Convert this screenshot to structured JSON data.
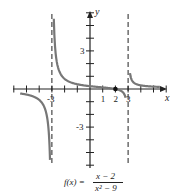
{
  "chart_data": {
    "type": "line",
    "title": "",
    "function": "f(x) = (x-2)/(x^2-9)",
    "xlabel": "x",
    "ylabel": "y",
    "xlim": [
      -6,
      6
    ],
    "ylim": [
      -6,
      6
    ],
    "grid": false,
    "x_tick_labels": [
      {
        "value": -3,
        "label": "-3"
      },
      {
        "value": 1,
        "label": "1"
      },
      {
        "value": 2,
        "label": "2"
      },
      {
        "value": 3,
        "label": "3"
      }
    ],
    "y_tick_labels": [
      {
        "value": 3,
        "label": "3"
      },
      {
        "value": -3,
        "label": "-3"
      }
    ],
    "vertical_asymptotes": [
      -3,
      3
    ],
    "horizontal_asymptote": 0,
    "marked_points": [
      {
        "x": 2,
        "y": 0
      }
    ],
    "y_intercept": 0.222,
    "series": [
      {
        "name": "f(x)",
        "branches": [
          {
            "x": [
              -5.5,
              -5,
              -4.5,
              -4,
              -3.5,
              -3.3,
              -3.15
            ],
            "y": [
              -0.35,
              -0.44,
              -0.58,
              -0.86,
              -1.69,
              -2.98,
              -5.9
            ]
          },
          {
            "x": [
              -2.85,
              -2.7,
              -2.5,
              -2,
              -1,
              0,
              1,
              2,
              2.5,
              2.8
            ],
            "y": [
              5.64,
              3.0,
              1.64,
              0.8,
              0.375,
              0.222,
              0.125,
              0,
              -0.18,
              -0.69
            ]
          },
          {
            "x": [
              3.15,
              3.3,
              3.5,
              4,
              4.5,
              5,
              5.5
            ],
            "y": [
              5.9,
              3.06,
              1.54,
              0.86,
              0.22,
              0.19,
              0.16
            ]
          }
        ]
      }
    ],
    "legend": null
  },
  "axes": {
    "x_label": "x",
    "y_label": "y"
  },
  "formula": {
    "lhs": "f(x) =",
    "numerator": "x − 2",
    "denominator": "x² − 9"
  }
}
